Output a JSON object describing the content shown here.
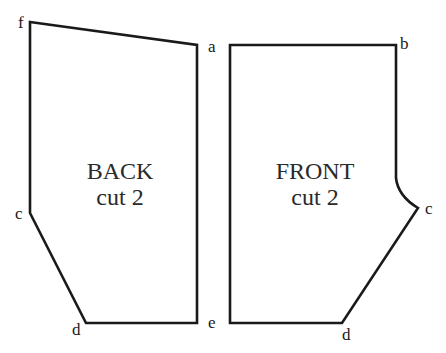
{
  "diagram": {
    "type": "sewing-pattern-pieces",
    "pieces": [
      {
        "name": "BACK",
        "instruction": "cut 2",
        "points": [
          {
            "label": "f",
            "x": 30,
            "y": 22
          },
          {
            "label": "a",
            "x": 197,
            "y": 45
          },
          {
            "label": "e",
            "x": 197,
            "y": 323
          },
          {
            "label": "d",
            "x": 86,
            "y": 323
          },
          {
            "label": "c",
            "x": 30,
            "y": 213
          }
        ]
      },
      {
        "name": "FRONT",
        "instruction": "cut 2",
        "points": [
          {
            "label": "b",
            "x": 396,
            "y": 45
          },
          {
            "label": "c",
            "x": 418,
            "y": 208
          },
          {
            "label": "d",
            "x": 342,
            "y": 323
          }
        ]
      }
    ],
    "labels": {
      "back_f": "f",
      "back_a": "a",
      "back_c": "c",
      "back_d": "d",
      "back_e": "e",
      "front_b": "b",
      "front_c": "c",
      "front_d": "d"
    },
    "colors": {
      "line": "#1a1a1a",
      "background": "#ffffff"
    }
  },
  "back": {
    "title": "BACK",
    "subtitle": "cut 2"
  },
  "front": {
    "title": "FRONT",
    "subtitle": "cut 2"
  }
}
